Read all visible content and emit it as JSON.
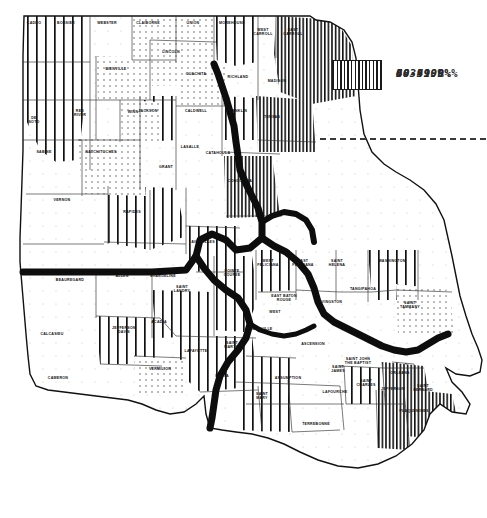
{
  "figure": {
    "type": "choropleth-map",
    "region": "Louisiana",
    "background_color": "#ffffff",
    "line_color": "#111111"
  },
  "legend": {
    "divider": "dashed-separator",
    "items": [
      {
        "label": "0-39.9%",
        "pattern": "sparse-dots",
        "swatch_class": "sw-0"
      },
      {
        "label": "40-49.9%",
        "pattern": "dense-dots",
        "swatch_class": "sw-1"
      },
      {
        "label": "50-59.9%",
        "pattern": "wide-vertical-stripes",
        "swatch_class": "sw-2"
      },
      {
        "label": "60- 100 %",
        "pattern": "narrow-vertical-stripes",
        "swatch_class": "sw-3"
      }
    ]
  },
  "parishes": [
    {
      "name": "CADDO",
      "x": 34,
      "y": 24,
      "class": "p50"
    },
    {
      "name": "BOSSIER",
      "x": 66,
      "y": 24,
      "class": "p50"
    },
    {
      "name": "WEBSTER",
      "x": 107,
      "y": 24,
      "class": "p0"
    },
    {
      "name": "CLAIBORNE",
      "x": 148,
      "y": 24,
      "class": "p40"
    },
    {
      "name": "UNION",
      "x": 193,
      "y": 24,
      "class": "p40"
    },
    {
      "name": "MOREHOUSE",
      "x": 232,
      "y": 24,
      "class": "p50"
    },
    {
      "name": "WEST CARROLL",
      "x": 263,
      "y": 31,
      "class": "p0"
    },
    {
      "name": "EAST CARROLL",
      "x": 293,
      "y": 31,
      "class": "p60"
    },
    {
      "name": "LINCOLN",
      "x": 171,
      "y": 53,
      "class": "p40"
    },
    {
      "name": "BIENVILLE",
      "x": 116,
      "y": 70,
      "class": "p40"
    },
    {
      "name": "OUACHITA",
      "x": 196,
      "y": 75,
      "class": "p40"
    },
    {
      "name": "RICHLAND",
      "x": 238,
      "y": 78,
      "class": "p0"
    },
    {
      "name": "MADISON",
      "x": 277,
      "y": 82,
      "class": "p60"
    },
    {
      "name": "DE SOTO",
      "x": 34,
      "y": 119,
      "class": "p50"
    },
    {
      "name": "RED RIVER",
      "x": 80,
      "y": 112,
      "class": "p0"
    },
    {
      "name": "JACKSON",
      "x": 148,
      "y": 112,
      "class": "p50"
    },
    {
      "name": "CALDWELL",
      "x": 196,
      "y": 112,
      "class": "p0"
    },
    {
      "name": "WINN",
      "x": 133,
      "y": 113,
      "class": "p40"
    },
    {
      "name": "FRANKLIN",
      "x": 237,
      "y": 112,
      "class": "p50"
    },
    {
      "name": "TENSAS",
      "x": 272,
      "y": 118,
      "class": "p60"
    },
    {
      "name": "SABINE",
      "x": 44,
      "y": 153,
      "class": "p0"
    },
    {
      "name": "NATCHITOCHES",
      "x": 101,
      "y": 153,
      "class": "p40"
    },
    {
      "name": "LASALLE",
      "x": 190,
      "y": 148,
      "class": "p0"
    },
    {
      "name": "CATAHOULA",
      "x": 218,
      "y": 154,
      "class": "p0"
    },
    {
      "name": "GRANT",
      "x": 166,
      "y": 168,
      "class": "p0"
    },
    {
      "name": "CONCORDIA",
      "x": 240,
      "y": 182,
      "class": "p60"
    },
    {
      "name": "VERNON",
      "x": 62,
      "y": 201,
      "class": "p0"
    },
    {
      "name": "RAPIDES",
      "x": 132,
      "y": 213,
      "class": "p50"
    },
    {
      "name": "AVOYELLES",
      "x": 203,
      "y": 243,
      "class": "p50"
    },
    {
      "name": "BEAUREGARD",
      "x": 70,
      "y": 281,
      "class": "p0"
    },
    {
      "name": "ALLEN",
      "x": 122,
      "y": 277,
      "class": "p0"
    },
    {
      "name": "EVANGELINE",
      "x": 163,
      "y": 277,
      "class": "p0"
    },
    {
      "name": "POINTE COUPEE",
      "x": 232,
      "y": 272,
      "class": "p50"
    },
    {
      "name": "WEST FELICIANA",
      "x": 268,
      "y": 262,
      "class": "p50"
    },
    {
      "name": "EAST FELICIANA",
      "x": 303,
      "y": 262,
      "class": "p0"
    },
    {
      "name": "SAINT HELENA",
      "x": 337,
      "y": 262,
      "class": "p0"
    },
    {
      "name": "WASHINGTON",
      "x": 392,
      "y": 262,
      "class": "p50"
    },
    {
      "name": "SAINT LANDRY",
      "x": 182,
      "y": 288,
      "class": "p50"
    },
    {
      "name": "EAST BATON ROUGE",
      "x": 284,
      "y": 297,
      "class": "p0"
    },
    {
      "name": "LIVINGSTON",
      "x": 330,
      "y": 303,
      "class": "p0"
    },
    {
      "name": "TANGIPAHOA",
      "x": 363,
      "y": 290,
      "class": "p0"
    },
    {
      "name": "SAINT TAMMANY",
      "x": 410,
      "y": 304,
      "class": "p40"
    },
    {
      "name": "WEST",
      "x": 275,
      "y": 313,
      "class": "p0"
    },
    {
      "name": "IBERVILLE",
      "x": 262,
      "y": 330,
      "class": "p50"
    },
    {
      "name": "JEFFERSON DAVIS",
      "x": 124,
      "y": 329,
      "class": "p50"
    },
    {
      "name": "ACADIA",
      "x": 159,
      "y": 323,
      "class": "p0"
    },
    {
      "name": "CALCASIEU",
      "x": 52,
      "y": 335,
      "class": "p50"
    },
    {
      "name": "LAFAYETTE",
      "x": 196,
      "y": 352,
      "class": "p50"
    },
    {
      "name": "SAINT MARTIN",
      "x": 232,
      "y": 344,
      "class": "p50"
    },
    {
      "name": "ASCENSION",
      "x": 313,
      "y": 345,
      "class": "p0"
    },
    {
      "name": "SAINT JAMES",
      "x": 338,
      "y": 368,
      "class": "p0"
    },
    {
      "name": "SAINT JOHN THE BAPTIST",
      "x": 358,
      "y": 360,
      "class": "p0"
    },
    {
      "name": "CAMERON",
      "x": 58,
      "y": 379,
      "class": "p0"
    },
    {
      "name": "VERMILION",
      "x": 160,
      "y": 370,
      "class": "p40"
    },
    {
      "name": "IBERIA",
      "x": 222,
      "y": 377,
      "class": "p50"
    },
    {
      "name": "ASSUMPTION",
      "x": 288,
      "y": 379,
      "class": "p50"
    },
    {
      "name": "SAINT CHARLES",
      "x": 366,
      "y": 382,
      "class": "p50"
    },
    {
      "name": "JEFFERSON",
      "x": 393,
      "y": 390,
      "class": "p60"
    },
    {
      "name": "ORLEANS",
      "x": 400,
      "y": 374,
      "class": "p50"
    },
    {
      "name": "SAINT BERNARD",
      "x": 423,
      "y": 387,
      "class": "p60"
    },
    {
      "name": "LAFOURCHE",
      "x": 335,
      "y": 393,
      "class": "p0"
    },
    {
      "name": "SAINT MARY",
      "x": 262,
      "y": 395,
      "class": "p50"
    },
    {
      "name": "TERREBONNE",
      "x": 316,
      "y": 425,
      "class": "p0"
    },
    {
      "name": "PLAQUEMINES",
      "x": 414,
      "y": 412,
      "class": "p60"
    }
  ]
}
